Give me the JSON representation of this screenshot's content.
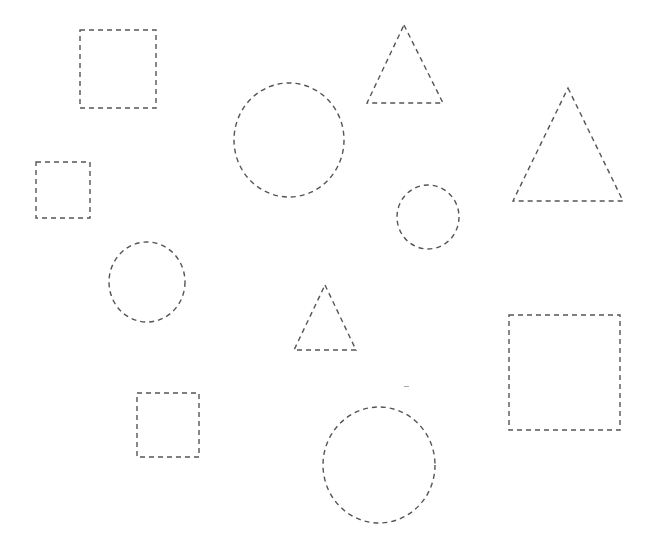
{
  "worksheet": {
    "title": "",
    "background": "#ffffff",
    "stroke_color": "#555555",
    "shapes": [
      {
        "type": "square",
        "name": "square-1",
        "x": 80,
        "y": 30,
        "w": 76,
        "h": 78
      },
      {
        "type": "square",
        "name": "square-2",
        "x": 36,
        "y": 162,
        "w": 54,
        "h": 56
      },
      {
        "type": "circle",
        "name": "circle-1",
        "cx": 289,
        "cy": 140,
        "rx": 55,
        "ry": 57
      },
      {
        "type": "triangle",
        "name": "triangle-1",
        "points": "404,25 443,103 367,103"
      },
      {
        "type": "triangle",
        "name": "triangle-2",
        "points": "568,88 623,201 513,201"
      },
      {
        "type": "circle",
        "name": "circle-2",
        "cx": 428,
        "cy": 217,
        "rx": 31,
        "ry": 32
      },
      {
        "type": "circle",
        "name": "circle-3",
        "cx": 147,
        "cy": 282,
        "rx": 38,
        "ry": 40
      },
      {
        "type": "triangle",
        "name": "triangle-3",
        "points": "325,285 356,350 294,350"
      },
      {
        "type": "square",
        "name": "square-3",
        "x": 137,
        "y": 393,
        "w": 62,
        "h": 64
      },
      {
        "type": "square",
        "name": "square-4",
        "x": 509,
        "y": 315,
        "w": 111,
        "h": 115
      },
      {
        "type": "circle",
        "name": "circle-4",
        "cx": 379,
        "cy": 465,
        "rx": 56,
        "ry": 58
      }
    ]
  }
}
